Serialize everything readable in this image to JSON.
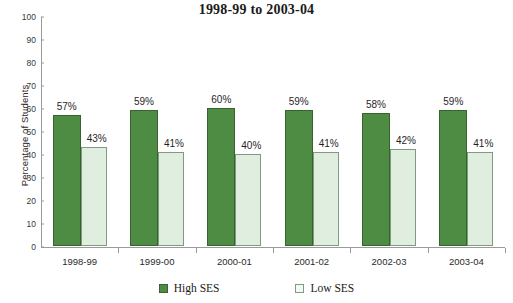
{
  "chart_data": {
    "type": "bar",
    "title": "1998-99 to 2003-04",
    "xlabel": "",
    "ylabel": "Percentage of Students",
    "ylim": [
      0,
      100
    ],
    "ytick_step": 10,
    "yticks": [
      100,
      90,
      80,
      70,
      60,
      50,
      40,
      30,
      20,
      10,
      0
    ],
    "grid": false,
    "legend_position": "bottom",
    "categories": [
      "1998-99",
      "1999-00",
      "2000-01",
      "2001-02",
      "2002-03",
      "2003-04"
    ],
    "series": [
      {
        "name": "High SES",
        "color": "#4e8b43",
        "border_color": "#376330",
        "values": [
          57,
          59,
          60,
          59,
          58,
          59
        ],
        "labels": [
          "57%",
          "59%",
          "60%",
          "59%",
          "58%",
          "59%"
        ]
      },
      {
        "name": "Low SES",
        "color": "#dfeedf",
        "border_color": "#7f9b7f",
        "values": [
          43,
          41,
          40,
          41,
          42,
          41
        ],
        "labels": [
          "43%",
          "41%",
          "40%",
          "41%",
          "42%",
          "41%"
        ]
      }
    ]
  },
  "colors": {
    "high_ses": "#4e8b43",
    "low_ses": "#dfeedf",
    "axis": "#9a9a9a",
    "text": "#1a1a1a",
    "background": "#ffffff"
  }
}
